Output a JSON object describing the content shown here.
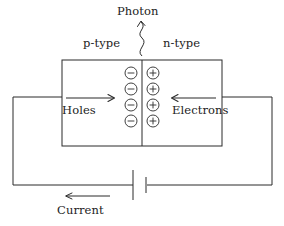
{
  "diagram": {
    "stroke_color": "#2b2b2b",
    "background_color": "#ffffff",
    "labels": {
      "photon": "Photon",
      "p_type": "p-type",
      "n_type": "n-type",
      "holes": "Holes",
      "electrons": "Electrons",
      "current": "Current"
    },
    "charges": {
      "negative_symbol": "−",
      "positive_symbol": "+",
      "negative_count": 4,
      "positive_count": 4,
      "negative_side": "p-type",
      "positive_side": "n-type"
    },
    "arrows": {
      "holes_direction": "right",
      "electrons_direction": "left",
      "current_direction": "left",
      "photon_direction": "up"
    },
    "components": {
      "semiconductor_block": "pn-junction-slab",
      "junction_line": "depletion-junction",
      "battery": "battery-cell",
      "wires": "external-circuit"
    }
  }
}
